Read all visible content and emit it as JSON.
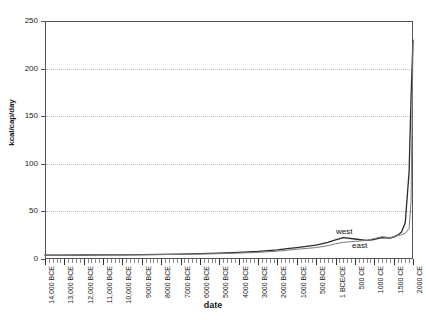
{
  "chart_data": {
    "type": "line",
    "title": "",
    "xlabel": "date",
    "ylabel": "kcal/cap/day",
    "ylim": [
      0,
      250
    ],
    "ytick_labels": [
      "0",
      "50",
      "100",
      "150",
      "200",
      "250"
    ],
    "ytick_values": [
      0,
      50,
      100,
      150,
      200,
      250
    ],
    "grid": true,
    "legend_position": "inline-annotation",
    "x_tick_labels": [
      "14,000 BCE",
      "13,000 BCE",
      "12,000 BCE",
      "11,000 BCE",
      "10,000 BCE",
      "9000 BCE",
      "8000 BCE",
      "7000 BCE",
      "6000 BCE",
      "5000 BCE",
      "4000 BCE",
      "3000 BCE",
      "2000 BCE",
      "1000 BCE",
      "500 BCE",
      "1 BCE/CE",
      "500 CE",
      "1000 CE",
      "1500 CE",
      "2000 CE"
    ],
    "x_values": [
      -14000,
      -13000,
      -12000,
      -11000,
      -10000,
      -9000,
      -8000,
      -7000,
      -6000,
      -5000,
      -4000,
      -3000,
      -2000,
      -1000,
      -500,
      0,
      500,
      1000,
      1500,
      2000
    ],
    "series": [
      {
        "name": "west",
        "color": "#2b2b2b",
        "x": [
          -14000,
          -13000,
          -12000,
          -11000,
          -10000,
          -9000,
          -8000,
          -7000,
          -6000,
          -5000,
          -4000,
          -3000,
          -2000,
          -1500,
          -1000,
          -500,
          -200,
          0,
          200,
          500,
          800,
          1000,
          1200,
          1400,
          1500,
          1600,
          1700,
          1800,
          1900,
          1950,
          2000
        ],
        "values": [
          4.0,
          4.1,
          4.2,
          4.3,
          4.4,
          4.6,
          4.8,
          5.2,
          5.6,
          6.2,
          7.0,
          8.0,
          9.5,
          10.8,
          12.0,
          14.5,
          17.5,
          20.0,
          22.5,
          21.0,
          19.5,
          20.5,
          22.5,
          22.0,
          23.0,
          25.0,
          28.0,
          38.0,
          92.0,
          170.0,
          230.0
        ]
      },
      {
        "name": "east",
        "color": "#7a7a7a",
        "x": [
          -14000,
          -13000,
          -12000,
          -11000,
          -10000,
          -9000,
          -8000,
          -7000,
          -6000,
          -5000,
          -4000,
          -3000,
          -2000,
          -1500,
          -1000,
          -500,
          -200,
          0,
          200,
          500,
          800,
          1000,
          1200,
          1400,
          1500,
          1600,
          1700,
          1800,
          1900,
          1950,
          2000
        ],
        "values": [
          4.0,
          4.0,
          4.1,
          4.2,
          4.3,
          4.4,
          4.6,
          4.9,
          5.2,
          5.6,
          6.2,
          7.0,
          8.2,
          9.2,
          10.2,
          12.0,
          14.0,
          16.0,
          17.5,
          18.5,
          19.5,
          21.5,
          23.5,
          22.5,
          23.5,
          24.5,
          25.5,
          27.0,
          32.0,
          60.0,
          228.0
        ]
      }
    ],
    "annotations": [
      {
        "text": "west",
        "series": "west"
      },
      {
        "text": "east",
        "series": "east"
      }
    ]
  }
}
